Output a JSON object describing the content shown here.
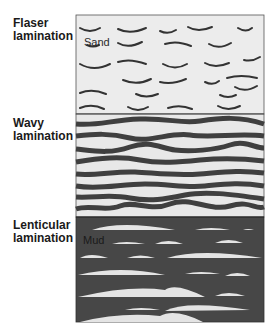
{
  "figure": {
    "sections": [
      {
        "id": "flaser",
        "label": "Flaser\nlamination",
        "inner_label": "Sand",
        "background": "#ececec",
        "stroke": "#3a3a3a"
      },
      {
        "id": "wavy",
        "label": "Wavy\nlamination",
        "background": "#e8e8e8",
        "stroke": "#3f3f3f"
      },
      {
        "id": "lenticular",
        "label": "Lenticular\nlamination",
        "inner_label": "Mud",
        "background": "#474747",
        "lens": "#e4e4e4"
      }
    ]
  }
}
